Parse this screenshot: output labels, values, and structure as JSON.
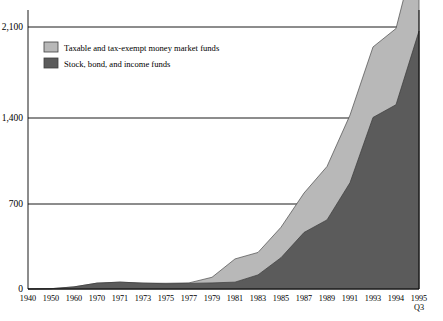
{
  "chart_data": {
    "type": "area",
    "stacked": true,
    "title": "",
    "subtitle": "",
    "xlabel": "",
    "ylabel": "",
    "ylim": [
      0,
      2100
    ],
    "yticks": [
      0,
      700,
      1400,
      2100
    ],
    "ytick_labels": [
      "0",
      "700",
      "1,400",
      "2,100"
    ],
    "grid": true,
    "legend_position": "top-left-inside",
    "categories": [
      "1940",
      "1950",
      "1960",
      "1970",
      "1971",
      "1973",
      "1975",
      "1977",
      "1979",
      "1981",
      "1983",
      "1985",
      "1987",
      "1989",
      "1991",
      "1993",
      "1994",
      "1995 Q3"
    ],
    "x_last_label_line2": "Q3",
    "series": [
      {
        "name": "Stock, bond, and income funds",
        "color": "#5b5b5b",
        "values": [
          0.5,
          2.5,
          17,
          47,
          55,
          47,
          42,
          45,
          49,
          55,
          113,
          251,
          453,
          554,
          852,
          1375,
          1477,
          2067
        ]
      },
      {
        "name": "Taxable and tax-exempt money market funds",
        "color": "#b8b8b8",
        "values": [
          0,
          0,
          0,
          0,
          0,
          0,
          4,
          4,
          45,
          186,
          180,
          244,
          316,
          428,
          542,
          565,
          611,
          745
        ]
      }
    ],
    "totals": [
      0.5,
      2.5,
      17,
      47,
      55,
      47,
      46,
      49,
      94,
      241,
      293,
      495,
      769,
      982,
      1394,
      1940,
      2088,
      2812
    ]
  },
  "legend": {
    "items": [
      {
        "label": "Taxable and tax-exempt money market funds",
        "color": "#b8b8b8"
      },
      {
        "label": "Stock, bond, and income funds",
        "color": "#5b5b5b"
      }
    ]
  }
}
